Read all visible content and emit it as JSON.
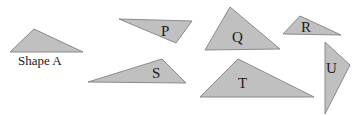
{
  "diagram": {
    "fill_color": "#c0c0c0",
    "stroke_color": "#8a8a8a",
    "text_color": "#1a1a1a",
    "shapes": [
      {
        "id": "A",
        "label": "Shape A",
        "points": "10,52 34,29 83,52",
        "label_x": 18,
        "label_y": 65,
        "label_size": 13
      },
      {
        "id": "P",
        "label": "P",
        "points": "119,19 192,21 176,43",
        "label_x": 161,
        "label_y": 36,
        "label_size": 15
      },
      {
        "id": "Q",
        "label": "Q",
        "points": "205,50 230,7 280,49",
        "label_x": 232,
        "label_y": 42,
        "label_size": 15
      },
      {
        "id": "R",
        "label": "R",
        "points": "283,34 300,16 341,35",
        "label_x": 301,
        "label_y": 32,
        "label_size": 15
      },
      {
        "id": "S",
        "label": "S",
        "points": "88,82 162,59 186,83",
        "label_x": 152,
        "label_y": 78,
        "label_size": 15
      },
      {
        "id": "T",
        "label": "T",
        "points": "200,97 238,59 314,97",
        "label_x": 238,
        "label_y": 88,
        "label_size": 15
      },
      {
        "id": "U",
        "label": "U",
        "points": "325,42 350,65 325,114",
        "label_x": 326,
        "label_y": 73,
        "label_size": 15
      }
    ]
  }
}
